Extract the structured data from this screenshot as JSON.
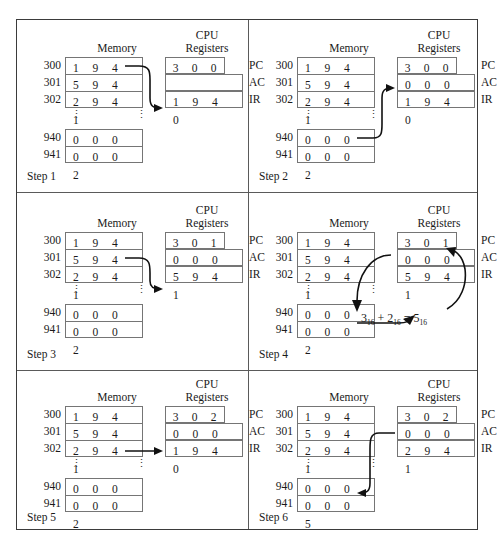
{
  "figure": {
    "headers": {
      "memory": "Memory",
      "cpu_line1": "CPU",
      "cpu_line2": "Registers"
    },
    "register_labels": {
      "pc": "PC",
      "ac": "AC",
      "ir": "IR"
    },
    "memory_addresses": {
      "a300": "300",
      "a301": "301",
      "a302": "302",
      "a940": "940",
      "a941": "941"
    },
    "vertical_ellipsis": "⋮"
  },
  "steps": [
    {
      "label": "Step 1",
      "memory": {
        "m300": [
          "1",
          "9",
          "4",
          "0"
        ],
        "m301": [
          "5",
          "9",
          "4",
          "1"
        ],
        "m302": [
          "2",
          "9",
          "4",
          "1"
        ],
        "m940": [
          "0",
          "0",
          "0",
          "3"
        ],
        "m941": [
          "0",
          "0",
          "0",
          "2"
        ]
      },
      "registers": {
        "pc": [
          "3",
          "0",
          "0"
        ],
        "ac": [
          "",
          "",
          "",
          ""
        ],
        "ir": [
          "1",
          "9",
          "4",
          "0"
        ]
      },
      "arrow": "memory-300-to-ir"
    },
    {
      "label": "Step 2",
      "memory": {
        "m300": [
          "1",
          "9",
          "4",
          "0"
        ],
        "m301": [
          "5",
          "9",
          "4",
          "1"
        ],
        "m302": [
          "2",
          "9",
          "4",
          "1"
        ],
        "m940": [
          "0",
          "0",
          "0",
          "3"
        ],
        "m941": [
          "0",
          "0",
          "0",
          "2"
        ]
      },
      "registers": {
        "pc": [
          "3",
          "0",
          "0"
        ],
        "ac": [
          "0",
          "0",
          "0",
          "3"
        ],
        "ir": [
          "1",
          "9",
          "4",
          "0"
        ]
      },
      "arrow": "memory-940-to-ac"
    },
    {
      "label": "Step 3",
      "memory": {
        "m300": [
          "1",
          "9",
          "4",
          "0"
        ],
        "m301": [
          "5",
          "9",
          "4",
          "1"
        ],
        "m302": [
          "2",
          "9",
          "4",
          "1"
        ],
        "m940": [
          "0",
          "0",
          "0",
          "3"
        ],
        "m941": [
          "0",
          "0",
          "0",
          "2"
        ]
      },
      "registers": {
        "pc": [
          "3",
          "0",
          "1"
        ],
        "ac": [
          "0",
          "0",
          "0",
          "3"
        ],
        "ir": [
          "5",
          "9",
          "4",
          "1"
        ]
      },
      "arrow": "memory-301-to-ir"
    },
    {
      "label": "Step 4",
      "memory": {
        "m300": [
          "1",
          "9",
          "4",
          "0"
        ],
        "m301": [
          "5",
          "9",
          "4",
          "1"
        ],
        "m302": [
          "2",
          "9",
          "4",
          "1"
        ],
        "m940": [
          "0",
          "0",
          "0",
          "3"
        ],
        "m941": [
          "0",
          "0",
          "0",
          "2"
        ]
      },
      "registers": {
        "pc": [
          "3",
          "0",
          "1"
        ],
        "ac": [
          "0",
          "0",
          "0",
          "5"
        ],
        "ir": [
          "5",
          "9",
          "4",
          "1"
        ]
      },
      "formula": {
        "a": "3",
        "a_sub": "16",
        "op1": "+",
        "b": "2",
        "b_sub": "16",
        "op2": "=",
        "c": "5",
        "c_sub": "16"
      },
      "arrow": "ac-and-941-into-sum-then-back-to-ac"
    },
    {
      "label": "Step 5",
      "memory": {
        "m300": [
          "1",
          "9",
          "4",
          "0"
        ],
        "m301": [
          "5",
          "9",
          "4",
          "1"
        ],
        "m302": [
          "2",
          "9",
          "4",
          "1"
        ],
        "m940": [
          "0",
          "0",
          "0",
          "3"
        ],
        "m941": [
          "0",
          "0",
          "0",
          "2"
        ]
      },
      "registers": {
        "pc": [
          "3",
          "0",
          "2"
        ],
        "ac": [
          "0",
          "0",
          "0",
          "5"
        ],
        "ir": [
          "1",
          "9",
          "4",
          "0"
        ]
      },
      "arrow": "memory-302-to-ir"
    },
    {
      "label": "Step 6",
      "memory": {
        "m300": [
          "1",
          "9",
          "4",
          "0"
        ],
        "m301": [
          "5",
          "9",
          "4",
          "1"
        ],
        "m302": [
          "2",
          "9",
          "4",
          "1"
        ],
        "m940": [
          "0",
          "0",
          "0",
          "3"
        ],
        "m941": [
          "0",
          "0",
          "0",
          "5"
        ]
      },
      "registers": {
        "pc": [
          "3",
          "0",
          "2"
        ],
        "ac": [
          "0",
          "0",
          "0",
          "5"
        ],
        "ir": [
          "2",
          "9",
          "4",
          "1"
        ]
      },
      "arrow": "ac-to-memory-941"
    }
  ],
  "colors": {
    "border": "#3b3b3b",
    "box": "#757575",
    "text": "#1a1a1a",
    "arrow": "#111111"
  }
}
